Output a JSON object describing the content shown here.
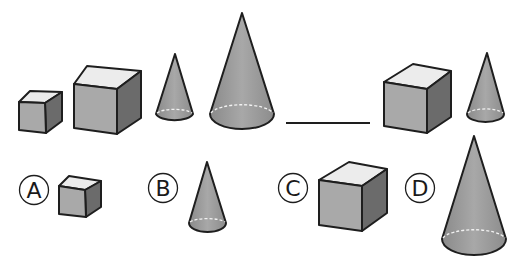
{
  "colors": {
    "outline": "#1e1e1e",
    "cube_top": "#ececec",
    "cube_front": "#a9a9a9",
    "cube_side": "#6b6b6b",
    "cone_body": "#9a9a9a",
    "dashed": "#f2f2f2"
  },
  "sequence": {
    "items": [
      {
        "shape": "cube",
        "size": "small"
      },
      {
        "shape": "cube",
        "size": "large"
      },
      {
        "shape": "cone",
        "size": "small"
      },
      {
        "shape": "cone",
        "size": "large"
      },
      {
        "shape": "blank",
        "size": ""
      },
      {
        "shape": "cube",
        "size": "large"
      },
      {
        "shape": "cone",
        "size": "small"
      }
    ]
  },
  "options": [
    {
      "label": "A",
      "shape": "cube",
      "size": "small"
    },
    {
      "label": "B",
      "shape": "cone",
      "size": "small"
    },
    {
      "label": "C",
      "shape": "cube",
      "size": "large"
    },
    {
      "label": "D",
      "shape": "cone",
      "size": "large"
    }
  ]
}
